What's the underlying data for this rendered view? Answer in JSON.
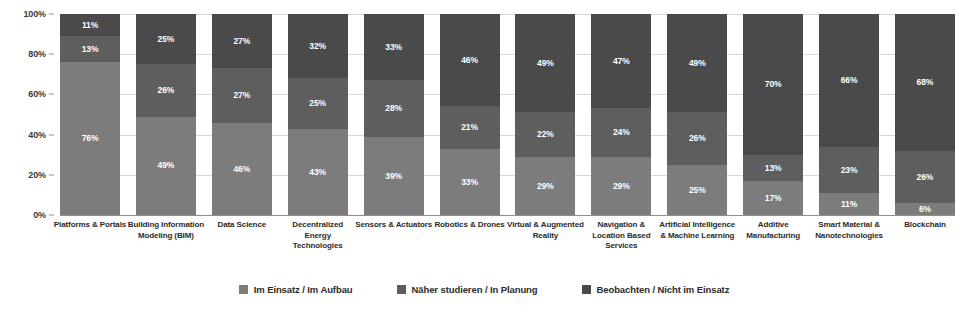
{
  "chart_data": {
    "type": "bar",
    "subtype": "stacked-bar-100-percent",
    "title": "",
    "subtitle": "",
    "xlabel": "",
    "ylabel": "",
    "ylim": [
      0,
      100
    ],
    "grid": true,
    "legend_position": "bottom-center",
    "y_ticks": [
      "0%",
      "20%",
      "40%",
      "60%",
      "80%",
      "100%"
    ],
    "y_tick_values": [
      0,
      20,
      40,
      60,
      80,
      100
    ],
    "categories": [
      "Platforms & Portals",
      "Building Information Modeling (BIM)",
      "Data Science",
      "Decentralized Energy Technologies",
      "Sensors & Actuators",
      "Robotics & Drones",
      "Virtual & Augmented Reality",
      "Navigation & Location Based Services",
      "Artificial Intelligence & Machine Learning",
      "Additive Manufacturing",
      "Smart Material & Nanotechnologies",
      "Blockchain"
    ],
    "series": [
      {
        "name": "Im Einsatz / Im Aufbau",
        "color": "#7c7c7c",
        "stack_position": "bottom",
        "values": [
          76,
          49,
          46,
          43,
          39,
          33,
          29,
          29,
          25,
          17,
          11,
          6
        ],
        "labels": [
          "76%",
          "49%",
          "46%",
          "43%",
          "39%",
          "33%",
          "29%",
          "29%",
          "25%",
          "17%",
          "11%",
          "6%"
        ]
      },
      {
        "name": "Näher studieren / In Planung",
        "color": "#5e5e5e",
        "stack_position": "middle",
        "values": [
          13,
          26,
          27,
          25,
          28,
          21,
          22,
          24,
          26,
          13,
          23,
          26
        ],
        "labels": [
          "13%",
          "26%",
          "27%",
          "25%",
          "28%",
          "21%",
          "22%",
          "24%",
          "26%",
          "13%",
          "23%",
          "26%"
        ]
      },
      {
        "name": "Beobachten / Nicht im Einsatz",
        "color": "#4a4a4a",
        "stack_position": "top",
        "values": [
          11,
          25,
          27,
          32,
          33,
          46,
          49,
          47,
          49,
          70,
          66,
          68
        ],
        "labels": [
          "11%",
          "25%",
          "27%",
          "32%",
          "33%",
          "46%",
          "49%",
          "47%",
          "49%",
          "70%",
          "66%",
          "68%"
        ]
      }
    ]
  },
  "legend": {
    "items": [
      {
        "label": "Im Einsatz / Im Aufbau",
        "color": "#7c7c7c"
      },
      {
        "label": "Näher studieren / In Planung",
        "color": "#5e5e5e"
      },
      {
        "label": "Beobachten / Nicht im Einsatz",
        "color": "#4a4a4a"
      }
    ]
  }
}
